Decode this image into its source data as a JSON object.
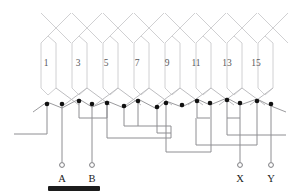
{
  "figure": {
    "kind": "winding-diagram",
    "colors": {
      "winding": "#d0d0d2",
      "zigzag": "#9b9b9e",
      "connection": "#8e8e92",
      "lead": "#8e8e92",
      "node": "#111111",
      "terminal_ring": "#7a7a7e",
      "coil_number": "#58585a",
      "terminal_label": "#1b1b1b",
      "caption_bar": "#1c1c1c",
      "background": "#ffffff"
    },
    "coil_numbers": [
      {
        "label": "1",
        "x": 46,
        "y": 64
      },
      {
        "label": "3",
        "x": 78,
        "y": 64
      },
      {
        "label": "5",
        "x": 106,
        "y": 64
      },
      {
        "label": "7",
        "x": 137,
        "y": 64
      },
      {
        "label": "9",
        "x": 167,
        "y": 64
      },
      {
        "label": "11",
        "x": 196,
        "y": 64
      },
      {
        "label": "13",
        "x": 227,
        "y": 64
      },
      {
        "label": "15",
        "x": 256,
        "y": 64
      }
    ],
    "terminals": [
      {
        "label": "A",
        "x": 62,
        "ring_y": 165,
        "text_y": 180,
        "lead_from_x": 62,
        "lead_from_y": 104
      },
      {
        "label": "B",
        "x": 92,
        "ring_y": 165,
        "text_y": 180,
        "lead_from_x": 92,
        "lead_from_y": 104
      },
      {
        "label": "X",
        "x": 240,
        "ring_y": 165,
        "text_y": 180,
        "lead_from_x": 240,
        "lead_from_y": 103
      },
      {
        "label": "Y",
        "x": 271,
        "ring_y": 165,
        "text_y": 180,
        "lead_from_x": 271,
        "lead_from_y": 104
      }
    ],
    "nodes": [
      {
        "x": 47,
        "y": 104
      },
      {
        "x": 62,
        "y": 104
      },
      {
        "x": 79,
        "y": 101
      },
      {
        "x": 92,
        "y": 104
      },
      {
        "x": 107,
        "y": 103
      },
      {
        "x": 124,
        "y": 106
      },
      {
        "x": 138,
        "y": 101
      },
      {
        "x": 157,
        "y": 107
      },
      {
        "x": 166,
        "y": 103
      },
      {
        "x": 182,
        "y": 105
      },
      {
        "x": 197,
        "y": 101
      },
      {
        "x": 210,
        "y": 103
      },
      {
        "x": 227,
        "y": 100
      },
      {
        "x": 240,
        "y": 103
      },
      {
        "x": 257,
        "y": 101
      },
      {
        "x": 271,
        "y": 104
      }
    ],
    "caption_bar": {
      "x": 48,
      "y": 186,
      "width": 52,
      "height": 5
    }
  }
}
